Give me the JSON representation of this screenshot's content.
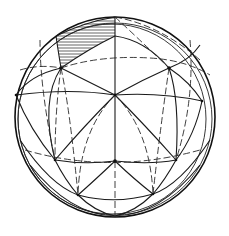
{
  "figure": {
    "colors": {
      "stroke": "#1a1a1a",
      "background": "#ffffff",
      "hatch": "#222222"
    },
    "sphere": {
      "cx": 115,
      "cy": 117,
      "r": 100
    },
    "vertices": [
      {
        "id": "top-left",
        "x": 61,
        "y": 68
      },
      {
        "id": "top-right",
        "x": 169,
        "y": 68
      },
      {
        "id": "center",
        "x": 115,
        "y": 95
      },
      {
        "id": "left",
        "x": 16,
        "y": 95
      },
      {
        "id": "right",
        "x": 202,
        "y": 101
      },
      {
        "id": "lower-center",
        "x": 115,
        "y": 161
      },
      {
        "id": "lower-left",
        "x": 55,
        "y": 160
      },
      {
        "id": "lower-right",
        "x": 176,
        "y": 160
      },
      {
        "id": "bottom-left",
        "x": 78,
        "y": 195
      },
      {
        "id": "bottom-right",
        "x": 153,
        "y": 194
      },
      {
        "id": "top-pole",
        "x": 115,
        "y": 17
      }
    ],
    "hatched_face": [
      "top-left",
      "top-pole",
      "top-right-arc"
    ],
    "line_styles": [
      "solid",
      "dashed"
    ]
  }
}
